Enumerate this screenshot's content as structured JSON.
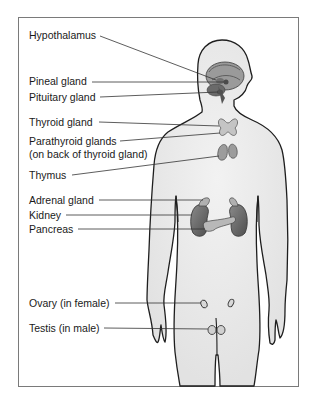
{
  "diagram": {
    "labels": [
      {
        "id": "hypothalamus",
        "text": "Hypothalamus",
        "x": 29,
        "y": 29
      },
      {
        "id": "pineal",
        "text": "Pineal gland",
        "x": 29,
        "y": 75
      },
      {
        "id": "pituitary",
        "text": "Pituitary gland",
        "x": 29,
        "y": 91
      },
      {
        "id": "thyroid",
        "text": "Thyroid gland",
        "x": 29,
        "y": 116
      },
      {
        "id": "parathyroid",
        "text": "Parathyroid glands",
        "x": 29,
        "y": 136
      },
      {
        "id": "parathyroid_note",
        "text": "(on back of thyroid gland)",
        "x": 29,
        "y": 149
      },
      {
        "id": "thymus",
        "text": "Thymus",
        "x": 29,
        "y": 169
      },
      {
        "id": "adrenal",
        "text": "Adrenal gland",
        "x": 29,
        "y": 193
      },
      {
        "id": "kidney",
        "text": "Kidney",
        "x": 29,
        "y": 208
      },
      {
        "id": "pancreas",
        "text": "Pancreas",
        "x": 29,
        "y": 223
      },
      {
        "id": "ovary",
        "text": "Ovary (in female)",
        "x": 29,
        "y": 297
      },
      {
        "id": "testis",
        "text": "Testis (in male)",
        "x": 29,
        "y": 323
      }
    ],
    "colors": {
      "frame": "#7a7a7a",
      "body_fill": "#ececec",
      "body_outline": "#1e1e1e",
      "leader_line": "#333333",
      "organ_dark": "#5a5a5a",
      "organ_mid": "#8c8c8c",
      "organ_light": "#c8c8c8"
    }
  }
}
